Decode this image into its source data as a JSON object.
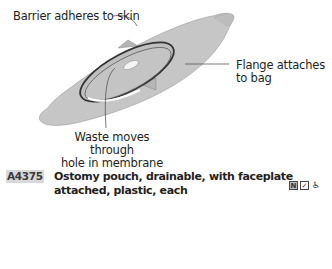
{
  "illustration": {
    "callouts": {
      "barrier": "Barrier adheres to skin",
      "flange_line1": "Flange attaches",
      "flange_line2": "to bag",
      "waste_line1": "Waste moves through",
      "waste_line2": "hole in membrane"
    },
    "colors": {
      "barrier_fill": "#c8c8c8",
      "flange_ring": "#3a3a3a"
    }
  },
  "entry": {
    "code": "A4375",
    "description": "Ostomy pouch, drainable, with faceplate attached, plastic, each",
    "icons": [
      {
        "name": "n-icon",
        "glyph": "N"
      },
      {
        "name": "checkbox-icon",
        "glyph": "✓"
      },
      {
        "name": "wheelchair-icon",
        "glyph": "♿"
      }
    ]
  }
}
